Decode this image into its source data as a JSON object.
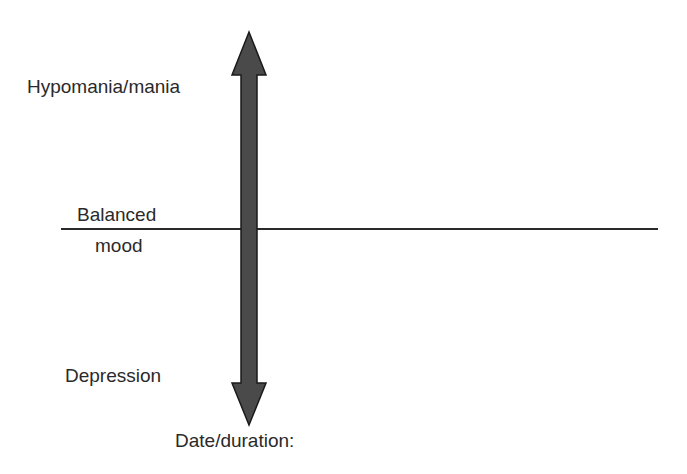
{
  "diagram": {
    "type": "mood-chart",
    "labels": {
      "high": "Hypomania/mania",
      "middle_line1": "Balanced",
      "middle_line2": "mood",
      "low": "Depression",
      "time_axis": "Date/duration:"
    },
    "colors": {
      "arrow_fill": "#4a4a4a",
      "arrow_stroke": "#1a1a1a",
      "baseline": "#2a2a2a",
      "text": "#2a2a2a"
    }
  }
}
